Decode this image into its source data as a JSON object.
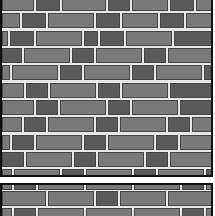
{
  "scene": {
    "type": "brick-wall-texture",
    "colors": {
      "mortar": "#e8e8e8",
      "brick_light": "#7a7a7a",
      "brick_dark": "#5a5a5a",
      "border": "#111111",
      "background": "#ffffff"
    },
    "row_pitch": 17.5,
    "brick_height": 15
  },
  "top_panel": {
    "rows": [
      {
        "y": -4,
        "bricks": [
          [
            0,
            32,
            "l"
          ],
          [
            34,
            24,
            "d"
          ],
          [
            60,
            44,
            "l"
          ],
          [
            106,
            22,
            "d"
          ],
          [
            130,
            36,
            "l"
          ],
          [
            168,
            24,
            "d"
          ],
          [
            194,
            20,
            "l"
          ]
        ]
      },
      {
        "y": 13,
        "bricks": [
          [
            0,
            18,
            "l"
          ],
          [
            20,
            24,
            "d"
          ],
          [
            46,
            46,
            "l"
          ],
          [
            94,
            24,
            "d"
          ],
          [
            120,
            36,
            "l"
          ],
          [
            158,
            24,
            "d"
          ],
          [
            184,
            30,
            "l"
          ]
        ]
      },
      {
        "y": 31,
        "bricks": [
          [
            0,
            6,
            "l"
          ],
          [
            8,
            24,
            "d"
          ],
          [
            34,
            46,
            "l"
          ],
          [
            82,
            14,
            "d"
          ],
          [
            98,
            24,
            "d"
          ],
          [
            124,
            46,
            "l"
          ],
          [
            172,
            40,
            "d"
          ]
        ]
      },
      {
        "y": 48,
        "bricks": [
          [
            0,
            20,
            "d"
          ],
          [
            22,
            46,
            "l"
          ],
          [
            70,
            22,
            "d"
          ],
          [
            94,
            46,
            "l"
          ],
          [
            142,
            22,
            "d"
          ],
          [
            166,
            46,
            "l"
          ]
        ]
      },
      {
        "y": 65,
        "bricks": [
          [
            0,
            8,
            "l"
          ],
          [
            10,
            46,
            "l"
          ],
          [
            58,
            22,
            "d"
          ],
          [
            82,
            46,
            "l"
          ],
          [
            130,
            22,
            "d"
          ],
          [
            154,
            46,
            "l"
          ],
          [
            202,
            12,
            "d"
          ]
        ]
      },
      {
        "y": 83,
        "bricks": [
          [
            0,
            22,
            "l"
          ],
          [
            24,
            22,
            "d"
          ],
          [
            48,
            46,
            "l"
          ],
          [
            96,
            22,
            "d"
          ],
          [
            120,
            46,
            "l"
          ],
          [
            168,
            44,
            "d"
          ]
        ]
      },
      {
        "y": 100,
        "bricks": [
          [
            0,
            32,
            "l"
          ],
          [
            34,
            22,
            "d"
          ],
          [
            58,
            46,
            "l"
          ],
          [
            106,
            22,
            "d"
          ],
          [
            130,
            46,
            "l"
          ],
          [
            178,
            34,
            "d"
          ]
        ]
      },
      {
        "y": 117,
        "bricks": [
          [
            0,
            20,
            "l"
          ],
          [
            22,
            22,
            "d"
          ],
          [
            46,
            46,
            "l"
          ],
          [
            94,
            22,
            "d"
          ],
          [
            118,
            46,
            "l"
          ],
          [
            166,
            22,
            "d"
          ],
          [
            190,
            24,
            "l"
          ]
        ]
      },
      {
        "y": 135,
        "bricks": [
          [
            0,
            8,
            "l"
          ],
          [
            10,
            22,
            "d"
          ],
          [
            34,
            46,
            "l"
          ],
          [
            82,
            22,
            "d"
          ],
          [
            106,
            46,
            "l"
          ],
          [
            154,
            22,
            "d"
          ],
          [
            178,
            34,
            "l"
          ]
        ]
      },
      {
        "y": 152,
        "bricks": [
          [
            0,
            22,
            "d"
          ],
          [
            24,
            46,
            "l"
          ],
          [
            72,
            22,
            "d"
          ],
          [
            96,
            46,
            "l"
          ],
          [
            144,
            22,
            "d"
          ],
          [
            168,
            44,
            "l"
          ]
        ]
      },
      {
        "y": 169,
        "bricks": [
          [
            0,
            10,
            "l"
          ],
          [
            12,
            46,
            "l"
          ],
          [
            60,
            22,
            "d"
          ],
          [
            84,
            46,
            "l"
          ],
          [
            132,
            22,
            "d"
          ],
          [
            156,
            46,
            "l"
          ],
          [
            204,
            8,
            "d"
          ]
        ]
      }
    ]
  },
  "bottom_panel": {
    "rows": [
      {
        "y": -10,
        "bricks": [
          [
            0,
            10,
            "l"
          ],
          [
            12,
            22,
            "d"
          ],
          [
            36,
            46,
            "l"
          ],
          [
            84,
            46,
            "l"
          ],
          [
            132,
            46,
            "l"
          ],
          [
            180,
            22,
            "d"
          ],
          [
            204,
            8,
            "l"
          ]
        ]
      },
      {
        "y": 6,
        "bricks": [
          [
            0,
            44,
            "l"
          ],
          [
            46,
            46,
            "l"
          ],
          [
            94,
            22,
            "d"
          ],
          [
            118,
            46,
            "l"
          ],
          [
            166,
            46,
            "l"
          ]
        ]
      },
      {
        "y": 23,
        "bricks": [
          [
            0,
            10,
            "l"
          ],
          [
            12,
            22,
            "d"
          ],
          [
            36,
            46,
            "l"
          ],
          [
            84,
            46,
            "l"
          ],
          [
            132,
            46,
            "l"
          ],
          [
            180,
            22,
            "d"
          ],
          [
            204,
            8,
            "l"
          ]
        ]
      }
    ]
  }
}
